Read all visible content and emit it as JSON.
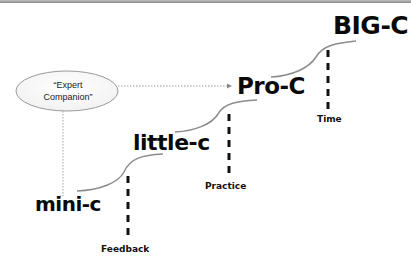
{
  "diagram": {
    "stages": [
      {
        "id": "mini-c",
        "label": "mini-c"
      },
      {
        "id": "little-c",
        "label": "little-c"
      },
      {
        "id": "pro-c",
        "label": "Pro-C"
      },
      {
        "id": "big-c",
        "label": "BIG-C"
      }
    ],
    "transitions": [
      {
        "from": "mini-c",
        "to": "little-c",
        "factor": "Feedback"
      },
      {
        "from": "little-c",
        "to": "pro-c",
        "factor": "Practice"
      },
      {
        "from": "pro-c",
        "to": "big-c",
        "factor": "Time"
      }
    ],
    "companion": {
      "line1": "“Expert",
      "line2": "Companion”",
      "connects_to": [
        "mini-c",
        "pro-c"
      ]
    },
    "colors": {
      "text": "#0a0a0a",
      "curve": "#8c8c8c",
      "dashed": "#111111",
      "dotted": "#9a9a9a",
      "ellipse_stroke": "#9a9a9a",
      "border": "#8a8a8a"
    }
  }
}
